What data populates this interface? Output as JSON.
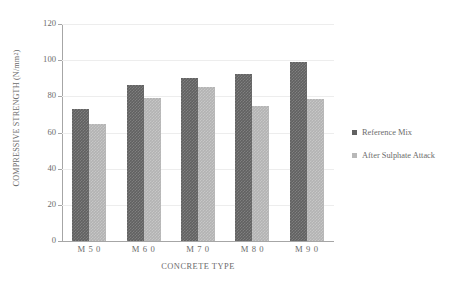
{
  "chart_data": {
    "type": "bar",
    "title": "",
    "xlabel": "CONCRETE TYPE",
    "ylabel": "COMPRESSIVE STRENGTH (N/mm2)",
    "ylabel_main": "COMPRESSIVE STRENGTH (N/mm",
    "ylabel_sup": "2",
    "ylabel_tail": ")",
    "categories": [
      "M 5 0",
      "M 6 0",
      "M 7 0",
      "M 8 0",
      "M 9 0"
    ],
    "series": [
      {
        "name": "Reference Mix",
        "values": [
          73,
          86,
          90,
          92.5,
          99
        ],
        "color": "#616161"
      },
      {
        "name": "After Sulphate Attack",
        "values": [
          64.5,
          79,
          85,
          74.5,
          78.5
        ],
        "color": "#b3b3b3"
      }
    ],
    "ylim": [
      0,
      120
    ],
    "ytick_labels": [
      "120",
      "100",
      "80",
      "60",
      "40",
      "20",
      "0"
    ],
    "ytick_values": [
      120,
      100,
      80,
      60,
      40,
      20,
      0
    ],
    "grid": true,
    "legend_position": "right"
  },
  "legend": {
    "items": [
      {
        "label": "Reference Mix"
      },
      {
        "label": "After Sulphate Attack"
      }
    ]
  }
}
